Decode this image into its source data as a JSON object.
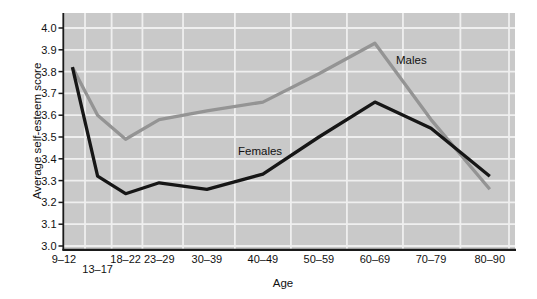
{
  "chart_data": {
    "type": "line",
    "title": "",
    "xlabel": "Age",
    "ylabel": "Average self-esteem score",
    "categories": [
      "9–12",
      "13–17",
      "18–22",
      "23–29",
      "30–39",
      "40–49",
      "50–59",
      "60–69",
      "70–79",
      "80–90"
    ],
    "age_midpoints": [
      10.5,
      15,
      20,
      26,
      34.5,
      44.5,
      54.5,
      64.5,
      74.5,
      85
    ],
    "series": [
      {
        "name": "Males",
        "color": "#949494",
        "values": [
          3.82,
          3.6,
          3.49,
          3.58,
          3.62,
          3.66,
          3.79,
          3.93,
          3.58,
          3.26
        ]
      },
      {
        "name": "Females",
        "color": "#161616",
        "values": [
          3.82,
          3.32,
          3.24,
          3.29,
          3.26,
          3.33,
          3.5,
          3.66,
          3.54,
          3.32
        ]
      }
    ],
    "y_ticks": [
      "4.0",
      "3.9",
      "3.8",
      "3.7",
      "3.6",
      "3.5",
      "3.4",
      "3.3",
      "3.2",
      "3.1",
      "3.0"
    ],
    "ylim": [
      3.0,
      4.0
    ],
    "xlim_age": [
      9.0,
      89.5
    ],
    "grid": true,
    "legend": "inline-labels",
    "colors": {
      "plot_background": "#c9c9c9",
      "gridline": "#efefef",
      "axis": "#1a1a1a",
      "text": "#111111",
      "figure_background": "#ffffff"
    }
  }
}
